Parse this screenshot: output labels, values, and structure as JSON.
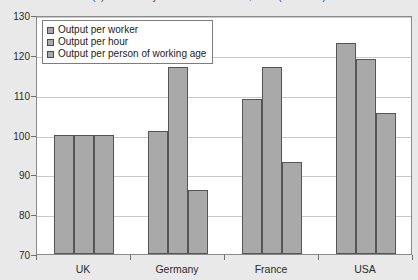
{
  "chart_data": {
    "type": "bar",
    "title": "(a) Productivity in selected countries, 2004 (UK = 100)",
    "xlabel": "",
    "ylabel": "",
    "ylim": [
      70,
      130
    ],
    "yticks": [
      70,
      80,
      90,
      100,
      110,
      120,
      130
    ],
    "grid": true,
    "legend_position": "top-left-inside",
    "categories": [
      "UK",
      "Germany",
      "France",
      "USA"
    ],
    "series": [
      {
        "name": "Output per worker",
        "values": [
          100,
          101,
          109,
          123
        ]
      },
      {
        "name": "Output per hour",
        "values": [
          100,
          117,
          117,
          119
        ]
      },
      {
        "name": "Output per person of working age",
        "values": [
          100,
          86,
          93,
          105.5
        ]
      }
    ],
    "colors": {
      "bar_fill": "#a9a9a9",
      "bar_border": "#555555",
      "gridline": "#c9c9c9",
      "plot_background": "#ffffff",
      "page_background": "#e9e9e9"
    }
  }
}
